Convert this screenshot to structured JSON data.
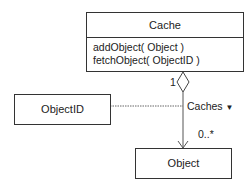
{
  "diagram": {
    "type": "UML class diagram",
    "classes": [
      {
        "id": "cache",
        "name": "Cache",
        "operations": [
          "addObject( Object )",
          "fetchObject( ObjectID )"
        ]
      },
      {
        "id": "objectid",
        "name": "ObjectID"
      },
      {
        "id": "object",
        "name": "Object"
      }
    ],
    "association": {
      "name": "Caches",
      "direction_marker": "▼",
      "source_multiplicity": "1",
      "target_multiplicity": "0..*",
      "aggregation": "Cache (hollow diamond) → Object (open arrow)",
      "qualifier_class": "ObjectID"
    }
  }
}
